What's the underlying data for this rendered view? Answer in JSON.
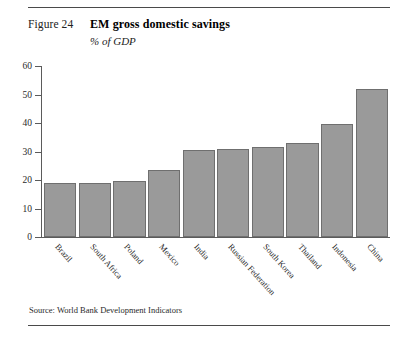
{
  "figure": {
    "label": "Figure 24",
    "title": "EM gross domestic savings",
    "subtitle": "% of GDP",
    "source": "Source: World Bank Development Indicators"
  },
  "chart_data": {
    "type": "bar",
    "title": "EM gross domestic savings",
    "subtitle": "% of GDP",
    "xlabel": "",
    "ylabel": "% of GDP",
    "ylim": [
      0,
      60
    ],
    "yticks": [
      0,
      10,
      20,
      30,
      40,
      50,
      60
    ],
    "grid": false,
    "legend": null,
    "bar_color": "#9a9a9a",
    "bar_edge_color": "#6f6f6f",
    "categories": [
      "Brazil",
      "South Africa",
      "Poland",
      "Mexico",
      "India",
      "Russian Federation",
      "South Korea",
      "Thailand",
      "Indonesia",
      "China"
    ],
    "values": [
      19,
      19,
      19.8,
      23.5,
      30.4,
      30.8,
      31.6,
      33,
      39.5,
      52
    ],
    "source": "Source: World Bank Development Indicators"
  }
}
